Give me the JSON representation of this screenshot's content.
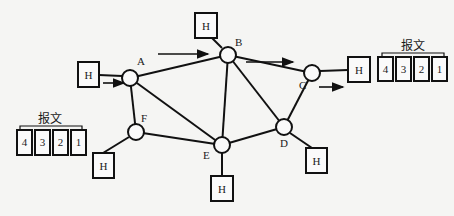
{
  "diagram": {
    "title": "",
    "nodes": [
      {
        "id": "A",
        "label": "A",
        "x": 130,
        "y": 78
      },
      {
        "id": "B",
        "label": "B",
        "x": 228,
        "y": 55
      },
      {
        "id": "C",
        "label": "C",
        "x": 312,
        "y": 73
      },
      {
        "id": "D",
        "label": "D",
        "x": 284,
        "y": 127
      },
      {
        "id": "E",
        "label": "E",
        "x": 222,
        "y": 145
      },
      {
        "id": "F",
        "label": "F",
        "x": 136,
        "y": 132
      }
    ],
    "hosts": [
      {
        "label": "H",
        "attached_to": "A"
      },
      {
        "label": "H",
        "attached_to": "B"
      },
      {
        "label": "H",
        "attached_to": "C"
      },
      {
        "label": "H",
        "attached_to": "D"
      },
      {
        "label": "H",
        "attached_to": "E"
      },
      {
        "label": "H",
        "attached_to": "F"
      }
    ],
    "links": [
      [
        "A",
        "B"
      ],
      [
        "A",
        "F"
      ],
      [
        "A",
        "E"
      ],
      [
        "B",
        "E"
      ],
      [
        "B",
        "C"
      ],
      [
        "B",
        "D"
      ],
      [
        "C",
        "D"
      ],
      [
        "F",
        "E"
      ],
      [
        "E",
        "D"
      ]
    ],
    "messages": [
      {
        "label": "报文",
        "packets": [
          "4",
          "3",
          "2",
          "1"
        ],
        "position": "right"
      },
      {
        "label": "报文",
        "packets": [
          "4",
          "3",
          "2",
          "1"
        ],
        "position": "left"
      }
    ],
    "arrows": [
      {
        "from": "host-A",
        "to": "A"
      },
      {
        "from": "A-region",
        "to": "B"
      },
      {
        "from": "B",
        "to": "C"
      },
      {
        "from": "C",
        "to": "host-C"
      }
    ]
  }
}
